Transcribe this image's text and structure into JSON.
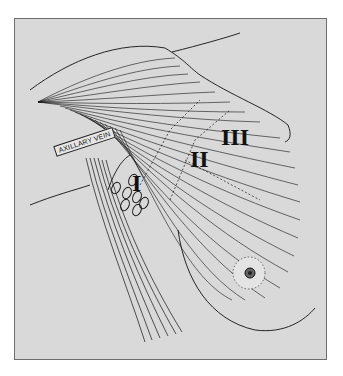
{
  "figure": {
    "type": "anatomical illustration",
    "labels": {
      "axillary_vein": "AXILLARY VEIN",
      "level_1": "I",
      "level_2": "II",
      "level_3": "III"
    },
    "colors": {
      "background": "#d9d9d9",
      "ink": "#111111",
      "frame_border": "#6e6e6e"
    }
  }
}
